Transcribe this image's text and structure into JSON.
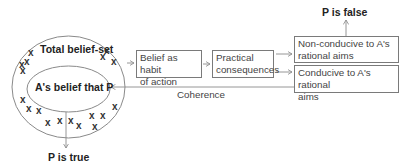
{
  "diagram": {
    "outer_set": {
      "label": "Total belief-set"
    },
    "inner_set": {
      "label": "A's belief that P"
    },
    "boxes": {
      "habit": {
        "label": "Belief as habit of action",
        "line1": "Belief as habit",
        "line2": "of action"
      },
      "consequences": {
        "label": "Practical consequences",
        "line1": "Practical",
        "line2": "consequences"
      },
      "non_conducive": {
        "label": "Non-conducive to A's rational aims",
        "line1": "Non-conducive to A's",
        "line2": "rational aims"
      },
      "conducive": {
        "label": "Conducive to A's rational aims",
        "line1": "Conducive to A's rational",
        "line2": "aims"
      }
    },
    "outcomes": {
      "true": "P is true",
      "false": "P is false"
    },
    "coherence_label": "Coherence",
    "belief_marker": "x",
    "colors": {
      "line": "#8a8a8a",
      "text": "#222222",
      "box_border": "#7a7a7a"
    }
  }
}
